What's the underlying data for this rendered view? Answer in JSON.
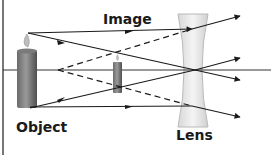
{
  "labels": {
    "image": "Image",
    "object": "Object",
    "lens": "Lens"
  },
  "colors": {
    "ray": "#1a1a1a",
    "axis": "#333333",
    "border": "#777777",
    "candle_dark": "#555555",
    "candle_light": "#9a9a9a",
    "lens_fill": "#e6e6e6",
    "lens_edge": "#b8b8b8"
  },
  "diagram": {
    "type": "diverging-lens-ray-diagram",
    "elements": [
      "object-candle",
      "virtual-image-candle",
      "concave-lens",
      "optical-axis",
      "light-rays",
      "virtual-rays-dashed"
    ]
  }
}
